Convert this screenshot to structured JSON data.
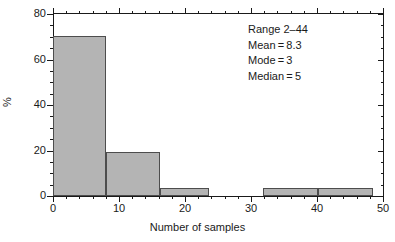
{
  "chart_data": {
    "type": "bar",
    "title": "",
    "xlabel": "Number of samples",
    "ylabel": "%",
    "xlim": [
      0,
      50
    ],
    "ylim": [
      0,
      80
    ],
    "grid": false,
    "legend": "none",
    "x_ticks": [
      {
        "value": 0,
        "label": "0"
      },
      {
        "value": 10,
        "label": "10"
      },
      {
        "value": 20,
        "label": "20"
      },
      {
        "value": 30,
        "label": "30"
      },
      {
        "value": 40,
        "label": "40"
      },
      {
        "value": 50,
        "label": "50"
      }
    ],
    "x_minor_tick_step": 2,
    "y_ticks": [
      {
        "value": 0,
        "label": "0"
      },
      {
        "value": 20,
        "label": "20"
      },
      {
        "value": 40,
        "label": "40"
      },
      {
        "value": 60,
        "label": "60"
      },
      {
        "value": 80,
        "label": "80"
      }
    ],
    "y_minor_tick_step": 5,
    "bar_fill": "#b4b4b4",
    "bar_edge": "#4d4d4d",
    "bins": [
      {
        "x0": 0.0,
        "x1": 8.0,
        "value": 70.5
      },
      {
        "x0": 8.0,
        "x1": 16.2,
        "value": 19.4
      },
      {
        "x0": 16.2,
        "x1": 23.7,
        "value": 3.5
      },
      {
        "x0": 31.8,
        "x1": 40.2,
        "value": 3.5
      },
      {
        "x0": 40.2,
        "x1": 48.5,
        "value": 3.5
      }
    ]
  },
  "annotation": {
    "range": "Range 2–44",
    "mean": "Mean = 8.3",
    "mode": "Mode = 3",
    "median": "Median = 5"
  }
}
